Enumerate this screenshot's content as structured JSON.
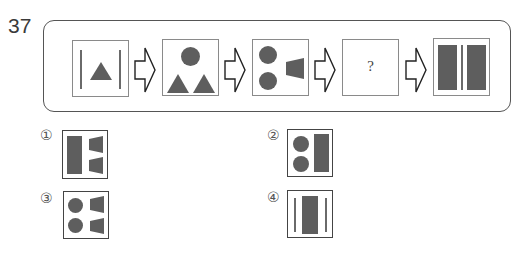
{
  "question": {
    "number": "37",
    "sequence": [
      {
        "id": "step-1",
        "content": "two vertical lines with a triangle between"
      },
      {
        "id": "step-2",
        "content": "one circle above two triangles"
      },
      {
        "id": "step-3",
        "content": "two circles and one trapezoid"
      },
      {
        "id": "step-4",
        "content": "?"
      },
      {
        "id": "step-5",
        "content": "two rectangles separated by a vertical line"
      }
    ],
    "unknown_symbol": "?",
    "arrow_icon": "hollow-right-arrow"
  },
  "options": [
    {
      "label": "①",
      "content": "one rectangle and two trapezoids"
    },
    {
      "label": "②",
      "content": "two circles and one rectangle"
    },
    {
      "label": "③",
      "content": "two circles and two trapezoids"
    },
    {
      "label": "④",
      "content": "one rectangle between two vertical lines"
    }
  ],
  "colors": {
    "shape_fill": "#5e5e5e",
    "box_border": "#8a8a8a",
    "frame_border": "#555555"
  }
}
